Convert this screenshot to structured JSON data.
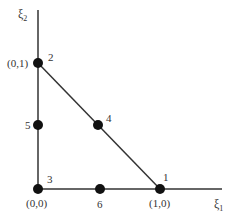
{
  "diagram": {
    "type": "finite-element-reference-triangle",
    "colors": {
      "line": "#333333",
      "node": "#111111",
      "text": "#333333",
      "background": "#ffffff"
    },
    "axes": {
      "x": {
        "label": "ξ",
        "subscript": "1"
      },
      "y": {
        "label": "ξ",
        "subscript": "2"
      }
    },
    "vertex_labels": {
      "origin": "(0,0)",
      "x_unit": "(1,0)",
      "y_unit": "(0,1)"
    },
    "nodes": [
      {
        "id": "1",
        "label": "1",
        "coord": "(1,0)"
      },
      {
        "id": "2",
        "label": "2",
        "coord": "(0,1)"
      },
      {
        "id": "3",
        "label": "3",
        "coord": "(0,0)"
      },
      {
        "id": "4",
        "label": "4",
        "coord": "(0.5,0.5)"
      },
      {
        "id": "5",
        "label": "5",
        "coord": "(0,0.5)"
      },
      {
        "id": "6",
        "label": "6",
        "coord": "(0.5,0)"
      }
    ]
  }
}
